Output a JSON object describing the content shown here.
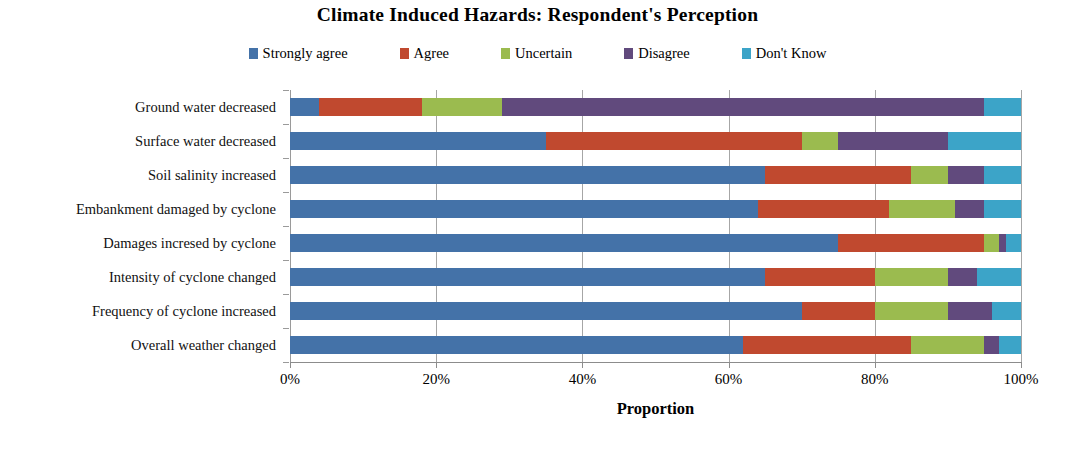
{
  "chart_data": {
    "type": "bar",
    "orientation": "horizontal",
    "stacked": true,
    "stack_mode": "percent",
    "title": "Climate Induced Hazards: Respondent's Perception",
    "xlabel": "Proportion",
    "ylabel": "",
    "xlim": [
      0,
      100
    ],
    "xticks": [
      0,
      20,
      40,
      60,
      80,
      100
    ],
    "xticklabels": [
      "0%",
      "20%",
      "40%",
      "60%",
      "80%",
      "100%"
    ],
    "grid": true,
    "grid_axis": "x",
    "legend_position": "top",
    "categories": [
      "Ground water decreased",
      "Surface water decreased",
      "Soil salinity increased",
      "Embankment damaged by cyclone",
      "Damages incresed by cyclone",
      "Intensity of cyclone changed",
      "Frequency of cyclone increased",
      "Overall weather changed"
    ],
    "series": [
      {
        "name": "Strongly agree",
        "color": "#4472a8",
        "values": [
          4,
          35,
          65,
          64,
          75,
          65,
          70,
          62
        ]
      },
      {
        "name": "Agree",
        "color": "#c0492f",
        "values": [
          14,
          35,
          20,
          18,
          20,
          15,
          10,
          23
        ]
      },
      {
        "name": "Uncertain",
        "color": "#9bbb4f",
        "values": [
          11,
          5,
          5,
          9,
          2,
          10,
          10,
          10
        ]
      },
      {
        "name": "Disagree",
        "color": "#614a7d",
        "values": [
          66,
          15,
          5,
          4,
          1,
          4,
          6,
          2
        ]
      },
      {
        "name": "Don't Know",
        "color": "#3ca4c8",
        "values": [
          5,
          10,
          5,
          5,
          2,
          6,
          4,
          3
        ]
      }
    ]
  },
  "legend": {
    "items": [
      {
        "label": "Strongly agree",
        "color": "#4472a8"
      },
      {
        "label": "Agree",
        "color": "#c0492f"
      },
      {
        "label": "Uncertain",
        "color": "#9bbb4f"
      },
      {
        "label": "Disagree",
        "color": "#614a7d"
      },
      {
        "label": "Don't Know",
        "color": "#3ca4c8"
      }
    ]
  }
}
